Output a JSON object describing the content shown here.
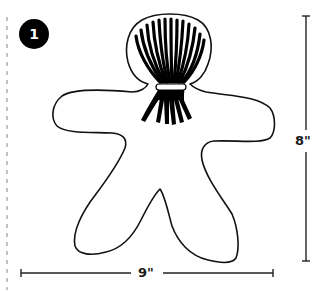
{
  "figure": {
    "step_badge": {
      "number": "1",
      "color": "#000000",
      "text_color": "#ffffff"
    },
    "shape": {
      "name": "gingerbread-person outline with tassel head",
      "stroke_color": "#111111"
    },
    "tassel": {
      "color": "#000000",
      "band_color": "#ffffff"
    },
    "dimensions": {
      "width_label": "9\"",
      "height_label": "8\""
    },
    "fold_line": {
      "style": "dashed",
      "color": "#9a9a9a"
    }
  }
}
